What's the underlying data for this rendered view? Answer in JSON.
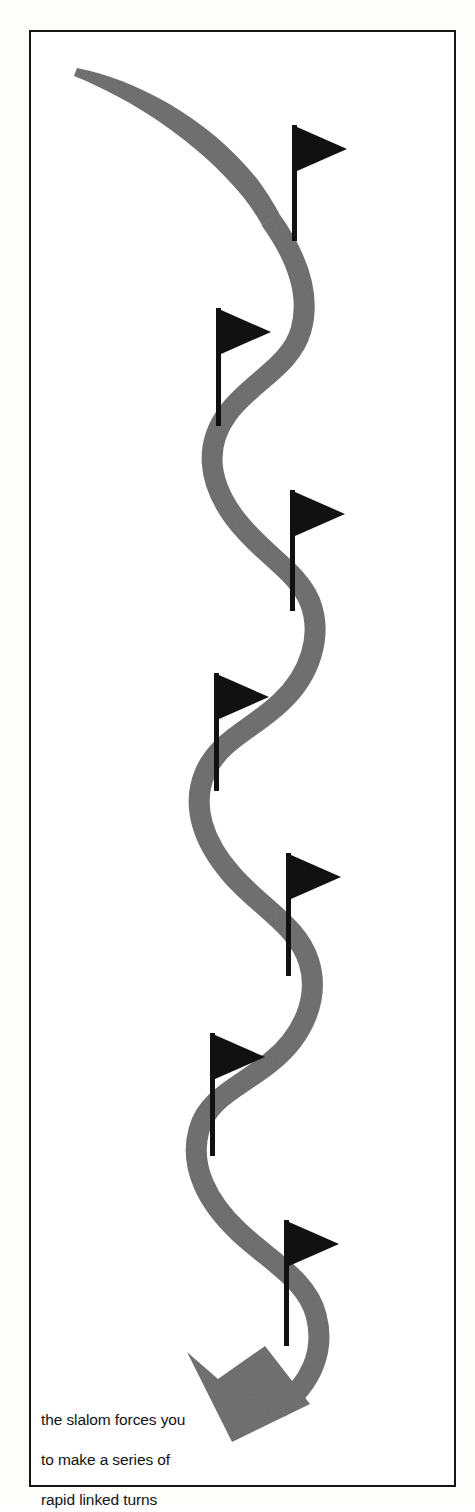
{
  "page": {
    "background_color": "#ffffff",
    "width": 475,
    "height": 1503
  },
  "frame": {
    "border_color": "#151515",
    "border_width_px": 2,
    "name": "figure-border"
  },
  "figure": {
    "path_color": "#737373",
    "flag_color": "#111111",
    "pole_color": "#111111",
    "arrow_color": "#737373",
    "flag_count": 7,
    "flags": [
      {
        "id": 1,
        "pole_x": 265,
        "pole_top_y": 95,
        "pole_bottom_y": 210,
        "flag_direction": "right"
      },
      {
        "id": 2,
        "pole_x": 189,
        "pole_top_y": 278,
        "pole_bottom_y": 395,
        "flag_direction": "right"
      },
      {
        "id": 3,
        "pole_x": 263,
        "pole_top_y": 460,
        "pole_bottom_y": 580,
        "flag_direction": "right"
      },
      {
        "id": 4,
        "pole_x": 187,
        "pole_top_y": 643,
        "pole_bottom_y": 760,
        "flag_direction": "right"
      },
      {
        "id": 5,
        "pole_x": 259,
        "pole_top_y": 823,
        "pole_bottom_y": 945,
        "flag_direction": "right"
      },
      {
        "id": 6,
        "pole_x": 183,
        "pole_top_y": 1003,
        "pole_bottom_y": 1125,
        "flag_direction": "right"
      },
      {
        "id": 7,
        "pole_x": 257,
        "pole_top_y": 1190,
        "pole_bottom_y": 1315,
        "flag_direction": "right"
      }
    ],
    "arrow": {
      "tip_x": 211,
      "tip_y": 1405,
      "direction": "down-left"
    }
  },
  "caption": {
    "name": "figure-caption",
    "line1": "the slalom forces you",
    "line2": "to make a series of",
    "line3": "rapid linked turns",
    "text_color": "#131313"
  }
}
